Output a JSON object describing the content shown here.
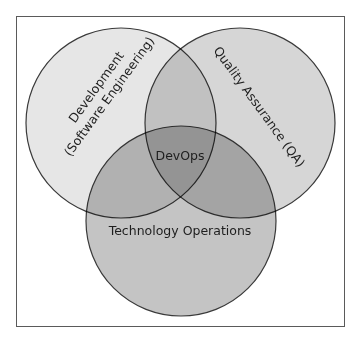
{
  "diagram": {
    "type": "venn",
    "frame": {
      "x": 16.5,
      "y": 16.5,
      "width": 328,
      "height": 310,
      "stroke": "#5a5a5a"
    },
    "circles": [
      {
        "id": "development",
        "label_line1": "Development",
        "label_line2": "(Software Engineering)",
        "cx": 121,
        "cy": 123,
        "r": 95,
        "fill": "#e6e6e6"
      },
      {
        "id": "quality-assurance",
        "label_line1": "Quality Assurance (QA)",
        "cx": 240,
        "cy": 123,
        "r": 95,
        "fill": "#d6d6d6"
      },
      {
        "id": "technology-operations",
        "label_line1": "Technology Operations",
        "cx": 181,
        "cy": 221,
        "r": 95,
        "fill": "#c4c4c4"
      }
    ],
    "center_label": "DevOps",
    "outline_color": "#3a3a3a",
    "text_color": "#1e1e1e"
  }
}
